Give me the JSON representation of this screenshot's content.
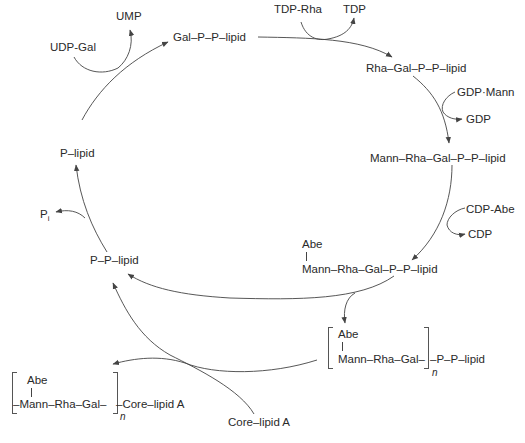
{
  "diagram": {
    "type": "biosynthetic-cycle",
    "nodes": {
      "gal_pp_lipid": "Gal–P–P–lipid",
      "rha_gal_pp_lipid": "Rha–Gal–P–P–lipid",
      "mann_rha_gal_pp_lipid": "Mann–Rha–Gal–P–P–lipid",
      "abe_top": "Abe",
      "abe_mann_rha_gal_pp_lipid": "Mann–Rha–Gal–P–P–lipid",
      "pp_lipid": "P–P–lipid",
      "p_lipid": "P–lipid",
      "polymer_abe": "Abe",
      "polymer_unit": "Mann–Rha–Gal–",
      "polymer_tail": "–P–P–lipid",
      "polymer_n": "n",
      "final_abe": "Abe",
      "final_unit": "–Mann–Rha–Gal–",
      "final_tail": "–Core–lipid A",
      "final_n": "n",
      "core_lipid_a": "Core–lipid A"
    },
    "cofactors": {
      "udp_gal": "UDP-Gal",
      "ump": "UMP",
      "tdp_rha": "TDP-Rha",
      "tdp": "TDP",
      "gdp_mann": "GDP·Mann",
      "gdp": "GDP",
      "cdp_abe": "CDP-Abe",
      "cdp": "CDP",
      "pi_main": "P",
      "pi_sub": "i"
    },
    "edges": [
      {
        "from": "P-lipid",
        "to": "Gal-P-P-lipid",
        "in": "UDP-Gal",
        "out": "UMP"
      },
      {
        "from": "Gal-P-P-lipid",
        "to": "Rha-Gal-P-P-lipid",
        "in": "TDP-Rha",
        "out": "TDP"
      },
      {
        "from": "Rha-Gal-P-P-lipid",
        "to": "Mann-Rha-Gal-P-P-lipid",
        "in": "GDP-Mann",
        "out": "GDP"
      },
      {
        "from": "Mann-Rha-Gal-P-P-lipid",
        "to": "Abe-Mann-Rha-Gal-P-P-lipid",
        "in": "CDP-Abe",
        "out": "CDP"
      },
      {
        "from": "Abe-Mann-Rha-Gal-P-P-lipid",
        "to": "P-P-lipid"
      },
      {
        "from": "Abe-Mann-Rha-Gal-P-P-lipid",
        "to": "[Abe-Mann-Rha-Gal]n-P-P-lipid"
      },
      {
        "from": "[Abe-Mann-Rha-Gal]n-P-P-lipid",
        "to": "[Abe-Mann-Rha-Gal]n-Core-lipid A",
        "in": "Core-lipid A"
      },
      {
        "from": "P-P-lipid",
        "to": "P-lipid",
        "out": "Pi"
      }
    ]
  }
}
